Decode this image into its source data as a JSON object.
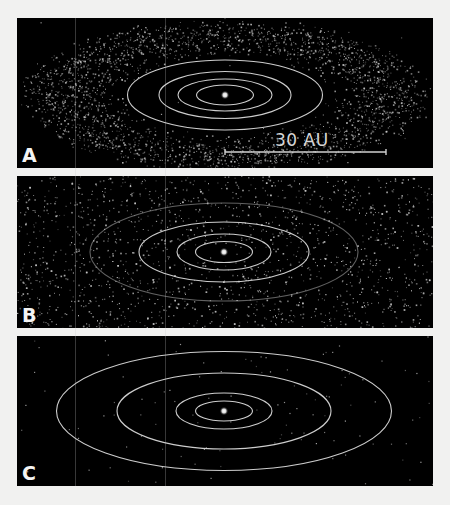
{
  "figure": {
    "background": "#f1f1f0",
    "panel_background": "#000000",
    "orbit_color": "#d8d8d8",
    "particle_color": "#c8c8c8",
    "star_color": "#ffffff"
  },
  "panels": [
    {
      "label": "A",
      "top": 18,
      "height": 150,
      "center": [
        208,
        77
      ],
      "orbits": [
        [
          97.5,
          35
        ],
        [
          66,
          23.5
        ],
        [
          47,
          16
        ],
        [
          28.5,
          10
        ]
      ],
      "faint_orbits": [],
      "disk": {
        "rx_in": 100,
        "ry_in": 38,
        "rx_out": 192,
        "ry_out": 72,
        "count": 2600
      },
      "scatter_count": 30,
      "scale_bar": {
        "label": "30 AU",
        "x1": 208,
        "x2": 369,
        "y": 134,
        "label_x": 258,
        "label_y": 114
      }
    },
    {
      "label": "B",
      "top": 176,
      "height": 152,
      "center": [
        207,
        76
      ],
      "orbits": [
        [
          85,
          30
        ],
        [
          47,
          18
        ],
        [
          28.5,
          10.5
        ]
      ],
      "faint_orbits": [
        [
          134,
          49
        ]
      ],
      "disk": {
        "rx_in": 20,
        "ry_in": 8,
        "rx_out": 330,
        "ry_out": 130,
        "count": 3600
      },
      "scatter_count": 400
    },
    {
      "label": "C",
      "top": 336,
      "height": 150,
      "center": [
        207,
        75
      ],
      "orbits": [
        [
          167.5,
          59.5
        ],
        [
          107,
          38
        ],
        [
          48,
          18
        ],
        [
          28.5,
          10
        ]
      ],
      "faint_orbits": [],
      "disk": {
        "rx_in": 0,
        "ry_in": 0,
        "rx_out": 0,
        "ry_out": 0,
        "count": 0
      },
      "scatter_count": 110
    }
  ],
  "artifacts_x": [
    75,
    165
  ]
}
